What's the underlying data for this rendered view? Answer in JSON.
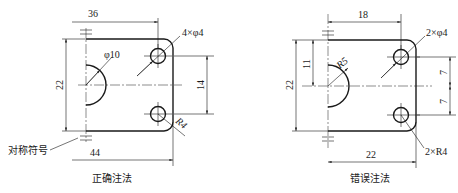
{
  "left_figure": {
    "caption": "正确注法",
    "dims": {
      "top_width": "36",
      "height": "22",
      "hole_spacing": "14",
      "bottom_width": "44",
      "semicircle_dia": "φ10",
      "holes": "4×φ4",
      "corner_radius": "R4"
    },
    "annotation": "对称符号"
  },
  "right_figure": {
    "caption": "错误注法",
    "dims": {
      "top_width": "18",
      "height": "22",
      "half_height": "11",
      "hole_offset_top": "7",
      "hole_offset_bottom": "7",
      "bottom_width": "22",
      "semicircle_radius": "R5",
      "holes": "2×φ4",
      "corner_radius": "2×R4"
    }
  }
}
